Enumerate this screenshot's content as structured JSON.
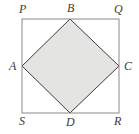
{
  "figure": {
    "kind": "geometry-diagram",
    "background_color": "#ffffff",
    "outer_square": {
      "name": "PQRS",
      "stroke_color": "#8a8a8a",
      "stroke_width": 1,
      "fill": "none",
      "corners": [
        {
          "label": "P",
          "position": "top-left",
          "x": 22,
          "y": 19
        },
        {
          "label": "Q",
          "position": "top-right",
          "x": 119,
          "y": 19
        },
        {
          "label": "R",
          "position": "bottom-right",
          "x": 119,
          "y": 113
        },
        {
          "label": "S",
          "position": "bottom-left",
          "x": 22,
          "y": 113
        }
      ]
    },
    "inner_square": {
      "name": "ABCD",
      "stroke_color": "#3c3c3c",
      "stroke_width": 1,
      "fill_color": "#e4e4e2",
      "vertices": [
        {
          "label": "A",
          "position": "left-midpoint",
          "x": 22,
          "y": 66
        },
        {
          "label": "B",
          "position": "top-midpoint",
          "x": 70,
          "y": 19
        },
        {
          "label": "C",
          "position": "right-midpoint",
          "x": 119,
          "y": 66
        },
        {
          "label": "D",
          "position": "bottom-midpoint",
          "x": 70,
          "y": 113
        }
      ]
    },
    "labels": {
      "P": "P",
      "B": "B",
      "Q": "Q",
      "A": "A",
      "C": "C",
      "S": "S",
      "D": "D",
      "R": "R"
    }
  }
}
